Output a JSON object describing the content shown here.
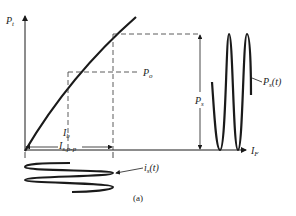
{
  "figure": {
    "caption": "(a)",
    "colors": {
      "ink": "#1a1a1a",
      "background": "#ffffff"
    }
  },
  "axes": {
    "y_label_main": "P",
    "y_label_sub": "t",
    "x_label_main": "I",
    "x_label_sub": "F"
  },
  "labels": {
    "operating_power_main": "P",
    "operating_power_sub": "o",
    "swing_power_main": "P",
    "swing_power_sub": "s",
    "output_signal_main": "P",
    "output_signal_sub": "s",
    "output_signal_arg": "(t)",
    "bias_current_main": "I",
    "bias_current_sub": "b",
    "pp_current_main": "I",
    "pp_current_sub": "s,p-p",
    "input_signal_main": "i",
    "input_signal_sub": "s",
    "input_signal_arg": "(t)"
  }
}
